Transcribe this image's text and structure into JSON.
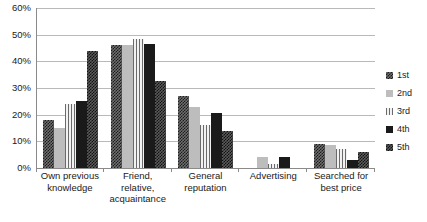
{
  "chart_data": {
    "type": "bar",
    "title": "",
    "xlabel": "",
    "ylabel": "",
    "ylim": [
      0,
      60
    ],
    "grid": true,
    "legend_position": "right",
    "ytick_labels": [
      "0%",
      "10%",
      "20%",
      "30%",
      "40%",
      "50%",
      "60%"
    ],
    "ytick_values": [
      0,
      10,
      20,
      30,
      40,
      50,
      60
    ],
    "categories": [
      "Own previous knowledge",
      "Friend, relative, acquaintance",
      "General reputation",
      "Advertising",
      "Searched for best price"
    ],
    "category_lines": [
      [
        "Own previous",
        "knowledge"
      ],
      [
        "Friend,",
        "relative,",
        "acquaintance"
      ],
      [
        "General",
        "reputation"
      ],
      [
        "Advertising"
      ],
      [
        "Searched for",
        "best price"
      ]
    ],
    "series": [
      {
        "name": "1st",
        "pattern": "checkerboard-dark",
        "values": [
          18.0,
          46.0,
          27.0,
          0.0,
          9.0
        ]
      },
      {
        "name": "2nd",
        "pattern": "solid-light-gray",
        "values": [
          15.0,
          46.0,
          23.0,
          4.0,
          8.5
        ]
      },
      {
        "name": "3rd",
        "pattern": "vertical-pinstripe",
        "values": [
          24.0,
          48.5,
          16.0,
          1.5,
          7.0
        ]
      },
      {
        "name": "4th",
        "pattern": "solid-black",
        "values": [
          25.0,
          46.5,
          20.5,
          4.0,
          3.0
        ]
      },
      {
        "name": "5th",
        "pattern": "checkerboard-dense",
        "values": [
          44.0,
          32.5,
          14.0,
          0.0,
          6.0
        ]
      }
    ]
  },
  "legend": {
    "entries": [
      {
        "label": "1st"
      },
      {
        "label": "2nd"
      },
      {
        "label": "3rd"
      },
      {
        "label": "4th"
      },
      {
        "label": "5th"
      }
    ]
  },
  "colors": {
    "gridline": "#b9b9b9",
    "axis": "#8a8a8a",
    "text": "#1a1a1a",
    "background": "#ffffff",
    "series_1st": "#1c1c1c",
    "series_2nd": "#bdbdbd",
    "series_3rd": "#e8e8e8",
    "series_4th": "#1a1a1a",
    "series_5th": "#111111"
  }
}
